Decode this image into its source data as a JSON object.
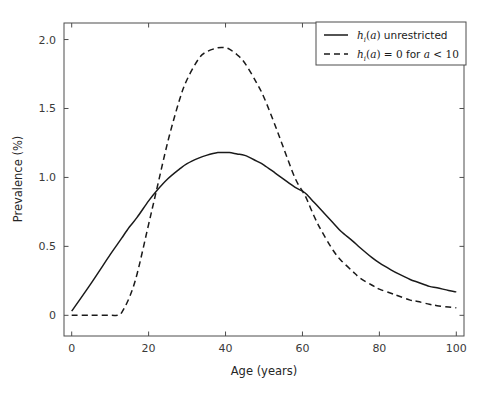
{
  "chart_data": {
    "type": "line",
    "title": "",
    "xlabel": "Age (years)",
    "ylabel": "Prevalence (%)",
    "xlim": [
      -2,
      102
    ],
    "ylim": [
      -0.15,
      2.12
    ],
    "xticks": [
      0,
      20,
      40,
      60,
      80,
      100
    ],
    "xtick_labels": [
      "0",
      "20",
      "40",
      "60",
      "80",
      "100"
    ],
    "yticks": [
      0,
      0.5,
      1.0,
      1.5,
      2.0
    ],
    "ytick_labels": [
      "0",
      "0.5",
      "1.0",
      "1.5",
      "2.0"
    ],
    "grid": false,
    "legend_position": "upper right",
    "x": [
      0,
      5,
      10,
      12,
      13,
      15,
      17,
      20,
      22,
      25,
      28,
      30,
      33,
      35,
      38,
      40,
      41,
      43,
      45,
      48,
      50,
      53,
      55,
      58,
      60,
      61,
      63,
      65,
      68,
      70,
      73,
      75,
      78,
      80,
      83,
      85,
      88,
      90,
      93,
      95,
      98,
      100
    ],
    "series": [
      {
        "name": "h_i(a) unrestricted",
        "legend_label": "h_i(a) unrestricted",
        "legend_parts": {
          "symbol": "h",
          "subscript": "i",
          "arg": "(a)",
          "text": " unrestricted"
        },
        "style": "solid",
        "color": "#1a1a1a",
        "linewidth": 1.5,
        "values": [
          0.03,
          0.23,
          0.44,
          0.52,
          0.56,
          0.64,
          0.71,
          0.83,
          0.9,
          0.99,
          1.06,
          1.1,
          1.14,
          1.16,
          1.18,
          1.18,
          1.18,
          1.17,
          1.16,
          1.12,
          1.09,
          1.03,
          0.99,
          0.93,
          0.9,
          0.88,
          0.82,
          0.76,
          0.67,
          0.61,
          0.54,
          0.49,
          0.42,
          0.38,
          0.33,
          0.3,
          0.26,
          0.24,
          0.21,
          0.2,
          0.18,
          0.17
        ]
      },
      {
        "name": "h_i(a) = 0 for a < 10",
        "legend_label": "h_i(a) = 0 for a < 10",
        "legend_parts": {
          "symbol": "h",
          "subscript": "i",
          "arg": "(a)",
          "eq": " = 0",
          "text": " for ",
          "cond_var": "a",
          "cond": " < 10"
        },
        "style": "dashed",
        "color": "#1a1a1a",
        "linewidth": 1.5,
        "dasharray": "6,4",
        "values": [
          0.0,
          0.0,
          0.0,
          0.0,
          0.02,
          0.13,
          0.3,
          0.66,
          0.9,
          1.26,
          1.56,
          1.71,
          1.86,
          1.91,
          1.94,
          1.94,
          1.93,
          1.89,
          1.83,
          1.69,
          1.58,
          1.37,
          1.22,
          1.0,
          0.9,
          0.85,
          0.72,
          0.61,
          0.47,
          0.4,
          0.32,
          0.27,
          0.22,
          0.19,
          0.16,
          0.14,
          0.11,
          0.1,
          0.08,
          0.07,
          0.06,
          0.055
        ]
      }
    ]
  },
  "axes": {
    "xlabel": "Age (years)",
    "ylabel": "Prevalence (%)"
  }
}
